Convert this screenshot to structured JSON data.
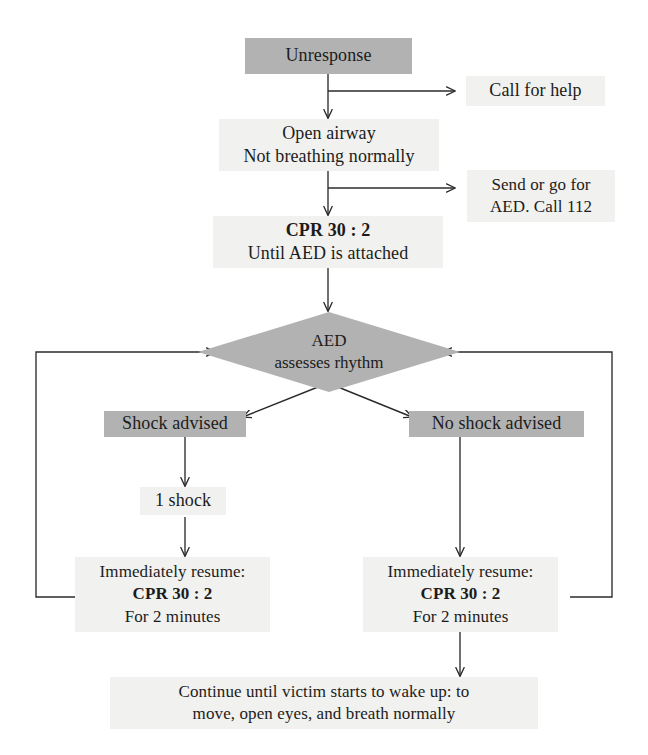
{
  "diagram": {
    "colors": {
      "node_fill_dark": "#b2b2b2",
      "node_fill_light": "#f1f1ef",
      "stroke": "#2b2b2b",
      "text": "#1c1c1c",
      "background": "#ffffff"
    },
    "nodes": {
      "unresponse": {
        "line1": "Unresponse"
      },
      "call_for_help": {
        "line1": "Call for help"
      },
      "open_airway": {
        "line1": "Open airway",
        "line2": "Not breathing normally"
      },
      "send_for_aed": {
        "line1": "Send or go for",
        "line2": "AED. Call 112"
      },
      "cpr_until_aed": {
        "line1": "CPR 30 : 2",
        "line2": "Until AED is attached"
      },
      "aed_assess": {
        "line1": "AED",
        "line2": "assesses rhythm"
      },
      "shock_advised": {
        "line1": "Shock advised"
      },
      "no_shock_advised": {
        "line1": "No shock advised"
      },
      "one_shock": {
        "line1": "1 shock"
      },
      "resume_left": {
        "line1": "Immediately resume:",
        "line2": "CPR 30 : 2",
        "line3": "For 2 minutes"
      },
      "resume_right": {
        "line1": "Immediately resume:",
        "line2": "CPR 30 : 2",
        "line3": "For 2 minutes"
      },
      "continue_note": {
        "line1": "Continue until victim starts to wake up: to",
        "line2": "move, open eyes, and breath normally"
      }
    },
    "edges": [
      {
        "from": "unresponse",
        "to": "call_for_help",
        "style": "branch-right"
      },
      {
        "from": "unresponse",
        "to": "open_airway",
        "style": "down"
      },
      {
        "from": "open_airway",
        "to": "send_for_aed",
        "style": "branch-right"
      },
      {
        "from": "open_airway",
        "to": "cpr_until_aed",
        "style": "down"
      },
      {
        "from": "cpr_until_aed",
        "to": "aed_assess",
        "style": "down"
      },
      {
        "from": "aed_assess",
        "to": "shock_advised",
        "style": "diagonal-left"
      },
      {
        "from": "aed_assess",
        "to": "no_shock_advised",
        "style": "diagonal-right"
      },
      {
        "from": "shock_advised",
        "to": "one_shock",
        "style": "down"
      },
      {
        "from": "one_shock",
        "to": "resume_left",
        "style": "down"
      },
      {
        "from": "no_shock_advised",
        "to": "resume_right",
        "style": "down"
      },
      {
        "from": "resume_left",
        "to": "aed_assess",
        "style": "loop-left"
      },
      {
        "from": "resume_right",
        "to": "aed_assess",
        "style": "loop-right"
      },
      {
        "from": "resume_right",
        "to": "continue_note",
        "style": "down"
      }
    ]
  }
}
